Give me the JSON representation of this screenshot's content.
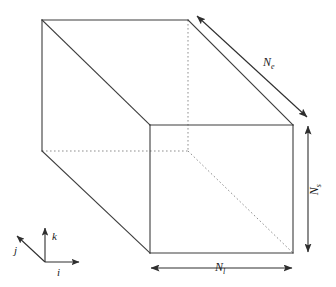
{
  "figure": {
    "background_color": "#ffffff",
    "line_color": "#3c3c3c",
    "hidden_line_color": "#8c8c8c",
    "text_color": "#1a1a1a"
  },
  "dimensions": [
    {
      "id": "n-e",
      "symbol": "N",
      "subscript": "e",
      "full": "Ne",
      "orientation": "diagonal-depth",
      "position": "top-right",
      "arrow": "double-headed"
    },
    {
      "id": "n-s",
      "symbol": "N",
      "subscript": "s",
      "full": "Ns",
      "orientation": "vertical",
      "position": "right",
      "arrow": "double-headed"
    },
    {
      "id": "n-l",
      "symbol": "N",
      "subscript": "l",
      "full": "Nl",
      "orientation": "horizontal",
      "position": "bottom",
      "arrow": "double-headed"
    }
  ],
  "axes": [
    {
      "id": "axis-i",
      "label": "i",
      "direction": "right"
    },
    {
      "id": "axis-j",
      "label": "j",
      "direction": "up-left"
    },
    {
      "id": "axis-k",
      "label": "k",
      "direction": "up"
    }
  ]
}
